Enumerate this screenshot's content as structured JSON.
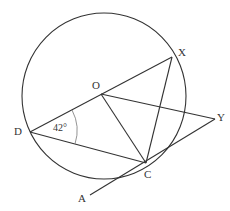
{
  "diagram": {
    "type": "circle-geometry",
    "points": {
      "O": {
        "label": "O"
      },
      "X": {
        "label": "X"
      },
      "Y": {
        "label": "Y"
      },
      "D": {
        "label": "D"
      },
      "C": {
        "label": "C"
      },
      "A": {
        "label": "A"
      }
    },
    "angle_label": "42°",
    "stroke_color": "#333333",
    "angle_arc_color": "#777777"
  }
}
